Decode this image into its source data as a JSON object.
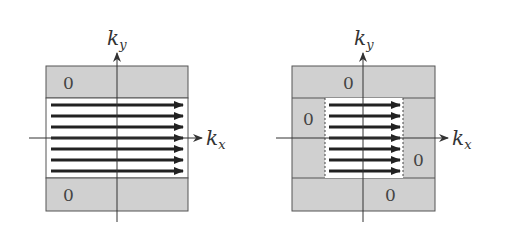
{
  "colors": {
    "gray_region": "#d0d0d0",
    "white_region": "#ffffff",
    "border": "#555555",
    "arrow": "#222222",
    "axis": "#333333"
  },
  "panels": [
    {
      "name": "left",
      "axis_x_label": "k",
      "axis_x_sub": "x",
      "axis_y_label": "k",
      "axis_y_sub": "y",
      "zero_labels": [
        "0",
        "0"
      ],
      "arrow_count": 7
    },
    {
      "name": "right",
      "axis_x_label": "k",
      "axis_x_sub": "x",
      "axis_y_label": "k",
      "axis_y_sub": "y",
      "zero_labels": [
        "0",
        "0",
        "0",
        "0"
      ],
      "arrow_count": 7
    }
  ]
}
